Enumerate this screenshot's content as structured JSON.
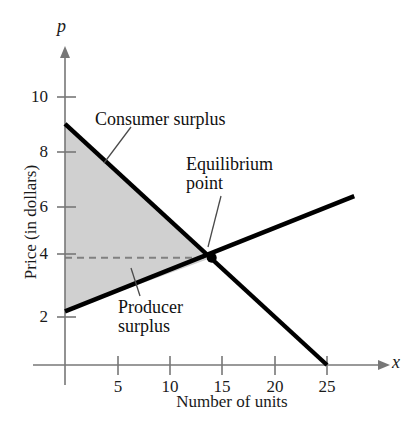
{
  "chart_data": {
    "type": "line",
    "title": "",
    "xlabel": "Number of units",
    "ylabel": "Price (in dollars)",
    "x_axis_symbol": "x",
    "y_axis_symbol": "p",
    "xlim": [
      0,
      28
    ],
    "ylim": [
      0,
      11.5
    ],
    "xticks": [
      5,
      10,
      15,
      20,
      25
    ],
    "yticks": [
      2,
      4,
      6,
      8,
      10
    ],
    "xtick_labels": [
      "5",
      "10",
      "15",
      "20",
      "25"
    ],
    "ytick_labels": [
      "2",
      "4",
      "6",
      "8",
      "10"
    ],
    "grid": false,
    "legend": "none",
    "series": [
      {
        "name": "demand",
        "points": [
          [
            0,
            9
          ],
          [
            25,
            0
          ]
        ],
        "color": "#000000"
      },
      {
        "name": "supply",
        "points": [
          [
            0,
            2
          ],
          [
            27.6,
            6.3
          ]
        ],
        "color": "#000000"
      }
    ],
    "equilibrium_point": {
      "x": 14,
      "p": 4
    },
    "shaded_region": {
      "name": "consumer-and-producer-surplus",
      "fill": "#d0d0d0",
      "vertices": [
        [
          0,
          9
        ],
        [
          14,
          4
        ],
        [
          0,
          2
        ]
      ]
    },
    "reference_line": {
      "name": "equilibrium-price-line",
      "value": 4,
      "from_x": 0,
      "to_x": 14,
      "style": "dashed",
      "color": "#808080"
    },
    "annotations": [
      {
        "name": "consumer-surplus",
        "text": "Consumer surplus",
        "x": 3.3,
        "y": 8.8
      },
      {
        "name": "equilibrium-point",
        "text_line_1": "Equilibrium",
        "text_line_2": "point",
        "x": 14.5,
        "y": 6.6
      },
      {
        "name": "producer-surplus",
        "text_line_1": "Producer",
        "text_line_2": "surplus",
        "x": 6.0,
        "y": 2.3
      }
    ]
  },
  "labels": {
    "consumer_surplus": "Consumer surplus",
    "equilibrium_line1": "Equilibrium",
    "equilibrium_line2": "point",
    "producer_line1": "Producer",
    "producer_line2": "surplus",
    "x_axis_name": "x",
    "y_axis_name": "p",
    "x_axis_title": "Number of units",
    "y_axis_title": "Price (in dollars)"
  }
}
